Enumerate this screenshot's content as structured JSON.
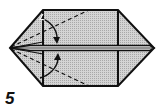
{
  "diagram": {
    "type": "origami-step",
    "step_number": "5",
    "colors": {
      "paper_fill": "#c8c8c8",
      "outline": "#111111",
      "background": "#ffffff"
    },
    "shapes": {
      "left_point": [
        10,
        48
      ],
      "right_point": [
        154,
        48
      ],
      "rect_top_left": [
        43,
        10
      ],
      "rect_top_right": [
        118,
        10
      ],
      "rect_bottom_left": [
        43,
        86
      ],
      "rect_bottom_right": [
        118,
        86
      ],
      "center_strip_y": [
        46,
        50
      ]
    },
    "annotations": {
      "fold_arrows": [
        "top-fold-down",
        "bottom-fold-up"
      ],
      "dashed_creases": [
        "left-point-to-top-edge",
        "left-point-to-bottom-edge"
      ]
    }
  }
}
